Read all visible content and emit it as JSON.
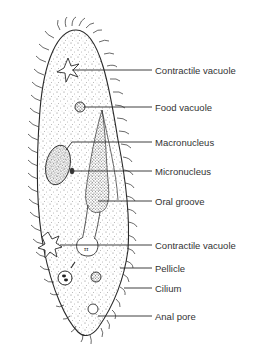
{
  "diagram": {
    "colors": {
      "ink": "#2a2a2a",
      "stipple": "#555555",
      "label_text": "#333333",
      "background": "#ffffff"
    },
    "labels": [
      {
        "id": "contractile-vacuole-top",
        "text": "Contractile vacuole",
        "y": 70,
        "target": [
          70,
          70
        ]
      },
      {
        "id": "food-vacuole",
        "text": "Food vacuole",
        "y": 107,
        "target": [
          82,
          107
        ]
      },
      {
        "id": "macronucleus",
        "text": "Macronucleus",
        "y": 142,
        "target": [
          66,
          150
        ]
      },
      {
        "id": "micronucleus",
        "text": "Micronucleus",
        "y": 171,
        "target": [
          72,
          171
        ]
      },
      {
        "id": "oral-groove",
        "text": "Oral groove",
        "y": 201,
        "target": [
          96,
          201
        ]
      },
      {
        "id": "contractile-vacuole-bottom",
        "text": "Contractile vacuole",
        "y": 245,
        "target": [
          62,
          245
        ]
      },
      {
        "id": "pellicle",
        "text": "Pellicle",
        "y": 268,
        "target": [
          118,
          268
        ]
      },
      {
        "id": "cilium",
        "text": "Cilium",
        "y": 288,
        "target": [
          122,
          288
        ]
      },
      {
        "id": "anal-pore",
        "text": "Anal pore",
        "y": 316,
        "target": [
          98,
          316
        ]
      }
    ]
  }
}
